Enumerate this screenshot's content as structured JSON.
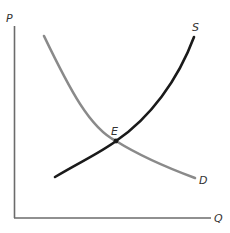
{
  "diagram": {
    "axes": {
      "y_label": "P",
      "x_label": "Q"
    },
    "curves": [
      {
        "name": "demand",
        "label": "D",
        "color": "#8a8a8a"
      },
      {
        "name": "supply",
        "label": "S",
        "color": "#1a1a1a"
      }
    ],
    "equilibrium": {
      "label": "E"
    },
    "colors": {
      "axis": "#6b6b6b",
      "demand": "#8a8a8a",
      "supply": "#1a1a1a",
      "text": "#333333"
    }
  }
}
